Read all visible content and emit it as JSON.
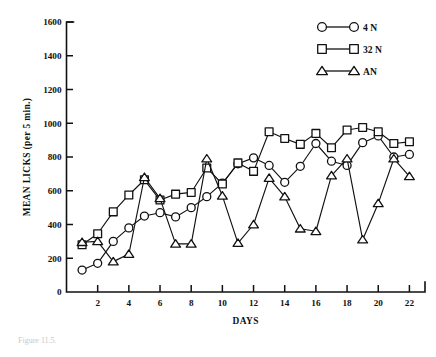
{
  "figure": {
    "caption_fragment": "Figure 11.5."
  },
  "chart_data": {
    "type": "line",
    "title": "",
    "xlabel": "DAYS",
    "ylabel": "MEAN LICKS (per 5 min.)",
    "xlim": [
      0,
      23
    ],
    "ylim": [
      0,
      1600
    ],
    "grid": false,
    "legend_position": "top-right",
    "x_ticks": [
      2,
      4,
      6,
      8,
      10,
      12,
      14,
      16,
      18,
      20,
      22
    ],
    "y_ticks": [
      0,
      200,
      400,
      600,
      800,
      1000,
      1200,
      1400,
      1600
    ],
    "x": [
      1,
      2,
      3,
      4,
      5,
      6,
      7,
      8,
      9,
      10,
      11,
      12,
      13,
      14,
      15,
      16,
      17,
      18,
      19,
      20,
      21,
      22
    ],
    "series": [
      {
        "name": "4 N",
        "marker": "circle",
        "values": [
          130,
          170,
          300,
          380,
          450,
          470,
          445,
          500,
          565,
          645,
          760,
          795,
          750,
          650,
          745,
          880,
          775,
          750,
          885,
          925,
          800,
          815
        ]
      },
      {
        "name": "32 N",
        "marker": "square",
        "values": [
          280,
          345,
          475,
          575,
          665,
          545,
          580,
          590,
          735,
          640,
          765,
          715,
          950,
          910,
          875,
          940,
          855,
          960,
          975,
          950,
          880,
          890
        ]
      },
      {
        "name": "AN",
        "marker": "triangle",
        "values": [
          295,
          300,
          180,
          225,
          680,
          555,
          285,
          285,
          790,
          570,
          290,
          400,
          675,
          565,
          375,
          360,
          690,
          790,
          310,
          525,
          790,
          685
        ]
      }
    ]
  },
  "legend": {
    "items": [
      {
        "label": "4 N",
        "marker": "circle"
      },
      {
        "label": "32 N",
        "marker": "square"
      },
      {
        "label": "AN",
        "marker": "triangle"
      }
    ]
  }
}
